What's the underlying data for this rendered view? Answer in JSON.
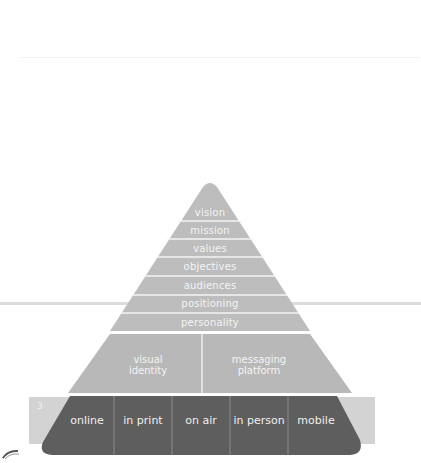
{
  "diagram": {
    "type": "brand-pyramid",
    "page_number": "3",
    "upper_tiers": [
      {
        "label": "vision"
      },
      {
        "label": "mission"
      },
      {
        "label": "values"
      },
      {
        "label": "objectives"
      },
      {
        "label": "audiences"
      },
      {
        "label": "positioning"
      },
      {
        "label": "personality"
      }
    ],
    "middle_tier": [
      {
        "label_line1": "visual",
        "label_line2": "identity"
      },
      {
        "label_line1": "messaging",
        "label_line2": "platform"
      }
    ],
    "channels": [
      {
        "label": "online"
      },
      {
        "label": "in print"
      },
      {
        "label": "on air"
      },
      {
        "label": "in person"
      },
      {
        "label": "mobile"
      }
    ],
    "colors": {
      "upper_fill": "#bdbdbd",
      "middle_fill": "#b8b8b8",
      "channel_fill": "#5e5e5e",
      "side_strip": "#d3d3d3",
      "divider": "#f4f4f4",
      "label_text": "#f4f4f4"
    }
  }
}
